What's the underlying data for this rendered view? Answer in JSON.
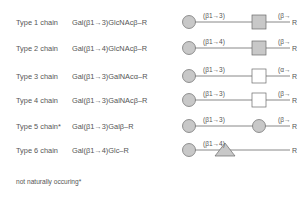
{
  "colors": {
    "fill": "#c8c8c8",
    "stroke": "#6a6a6a",
    "text": "#555555"
  },
  "rows": [
    {
      "label": "Type 1 chain",
      "formula": "Gal(β1→3)GlcNAcβ–R",
      "link1": "(β1→3)",
      "link2": "(β→",
      "second": "square-filled",
      "end": "R",
      "y": 12
    },
    {
      "label": "Type 2 chain",
      "formula": "Gal(β1→4)GlcNAcβ–R",
      "link1": "(β1→4)",
      "link2": "(β→",
      "second": "square-filled",
      "end": "R",
      "y": 38
    },
    {
      "label": "Type 3 chain",
      "formula": "Gal(β1→3)GalNAcα–R",
      "link1": "(β1→3)",
      "link2": "(α→",
      "second": "square-open",
      "end": "R",
      "y": 66
    },
    {
      "label": "Type 4 chain",
      "formula": "Gal(β1→3)GalNAcβ–R",
      "link1": "(β1→3)",
      "link2": "(β→",
      "second": "square-open",
      "end": "R",
      "y": 90
    },
    {
      "label": "Type 5 chain*",
      "formula": "Gal(β1→3)Galβ–R",
      "link1": "(β1→3)",
      "link2": "(β→",
      "second": "circle-filled",
      "end": "R",
      "y": 116
    },
    {
      "label": "Type 6 chain",
      "formula": "Gal(β1→4)Glc–R",
      "link1": "(β1→4)",
      "link2": "",
      "second": "triangle-filled",
      "end": "R",
      "y": 140
    }
  ],
  "footnote": "not naturally occuring*"
}
